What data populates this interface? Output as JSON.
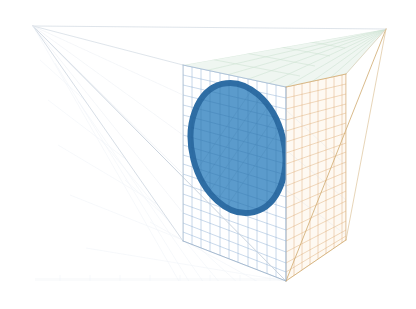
{
  "figure": {
    "title": "",
    "background_color": "#ffffff",
    "width": 416,
    "height": 309
  },
  "chart_data": {
    "type": "scatter",
    "title": "",
    "subtitle": "",
    "xlabel": "",
    "ylabel": "",
    "zlabel": "",
    "projection": "3d-perspective",
    "grid": true,
    "legend": "none",
    "axis_ticks": [],
    "tick_labels": [],
    "annotations": [],
    "series": [
      {
        "name": "ellipse-region",
        "type": "ellipse",
        "fill_color": "#4d93c8",
        "stroke_color": "#2e6da4",
        "stroke_width": 6,
        "center": [
          238,
          148
        ],
        "radius_x": 46,
        "radius_y": 66,
        "rotation_deg": -14,
        "opacity": 0.92
      }
    ],
    "planes": [
      {
        "name": "back-plane",
        "color": "#6f9fd0",
        "grid_rows": 18,
        "grid_cols": 11,
        "opacity": 0.55
      },
      {
        "name": "right-plane",
        "color": "#d9a66b",
        "grid_rows": 18,
        "grid_cols": 8,
        "opacity": 0.5
      },
      {
        "name": "top-plane",
        "color": "#9fc7a6",
        "grid_rows": 6,
        "grid_cols": 10,
        "opacity": 0.32
      },
      {
        "name": "floor-plane",
        "color": "#b9c6d4",
        "grid_rows": 6,
        "grid_cols": 12,
        "opacity": 0.28
      }
    ]
  },
  "geometry": {
    "vertex_left": [
      33,
      26
    ],
    "vertex_top_right": [
      386,
      29
    ],
    "vertex_bottom": [
      286,
      281
    ],
    "back_plane_corners": [
      [
        183,
        65
      ],
      [
        286,
        87
      ],
      [
        286,
        281
      ],
      [
        183,
        241
      ]
    ],
    "right_plane_corners": [
      [
        286,
        87
      ],
      [
        346,
        74
      ],
      [
        346,
        240
      ],
      [
        286,
        281
      ]
    ],
    "edge_color": "#c9d3de",
    "grid_color_back": "#88a9cd",
    "grid_color_right": "#d8ab74"
  },
  "colors": {
    "ellipse_fill": "#4d93c8",
    "ellipse_stroke": "#2e6da4",
    "grid_blue": "#7ba3cc",
    "grid_orange": "#dcab72",
    "grid_green": "#a8cfae",
    "grid_faint": "#dde5ec",
    "background": "#ffffff"
  }
}
